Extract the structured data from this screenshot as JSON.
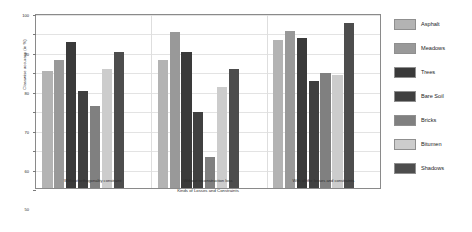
{
  "chart_data": {
    "type": "bar",
    "title": "",
    "xlabel": "Kinds of Losses and Constraints",
    "ylabel": "Classwise accuracy (in %)",
    "ylim": [
      10,
      100
    ],
    "yticks": [
      10,
      20,
      30,
      40,
      50,
      60,
      70,
      80,
      90,
      100
    ],
    "grid": true,
    "legend_position": "right",
    "categories": [
      "Without orthogonality constraint",
      "Without reconstruction loss",
      "With all the losses and constraints"
    ],
    "series": [
      {
        "name": "Asphalt",
        "color": "#b3b3b3",
        "values": [
          70,
          76,
          86
        ]
      },
      {
        "name": "Meadows",
        "color": "#999999",
        "values": [
          76,
          90,
          91
        ]
      },
      {
        "name": "Trees",
        "color": "#3a3a3a",
        "values": [
          85,
          80,
          87
        ]
      },
      {
        "name": "Bare Soil",
        "color": "#404040",
        "values": [
          60,
          49,
          65
        ]
      },
      {
        "name": "Bricks",
        "color": "#808080",
        "values": [
          52,
          26,
          69
        ]
      },
      {
        "name": "Bitumen",
        "color": "#cccccc",
        "values": [
          71,
          62,
          68
        ]
      },
      {
        "name": "Shadows",
        "color": "#4d4d4d",
        "values": [
          80,
          71,
          95
        ]
      }
    ]
  }
}
